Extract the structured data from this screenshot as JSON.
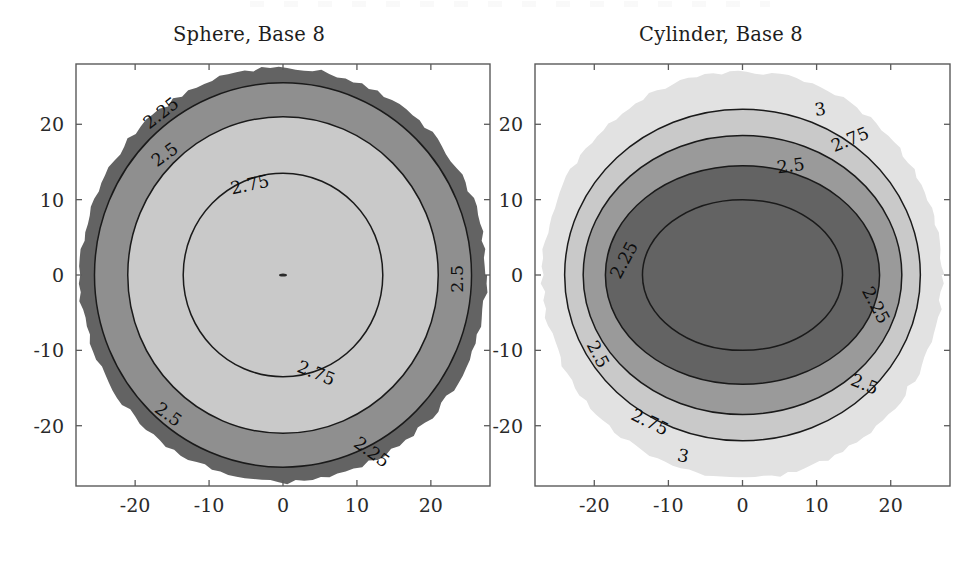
{
  "figure": {
    "width": 980,
    "height": 574,
    "background": "#ffffff"
  },
  "chart_data": [
    {
      "type": "contour",
      "panel": "left",
      "title": "Sphere, Base 8",
      "xlabel": "",
      "ylabel": "",
      "xlim": [
        -28,
        28
      ],
      "ylim": [
        -28,
        28
      ],
      "xticks": [
        "-20",
        "-10",
        "0",
        "10",
        "20"
      ],
      "xtick_values": [
        -20,
        -10,
        0,
        10,
        20
      ],
      "yticks": [
        "20",
        "10",
        "0",
        "-10",
        "-20"
      ],
      "ytick_values": [
        20,
        10,
        0,
        -10,
        -20
      ],
      "grid": false,
      "legend": "none",
      "levels": [
        2.25,
        2.5,
        2.75
      ],
      "level_labels": [
        "2.25",
        "2.5",
        "2.75"
      ],
      "fill_direction": "dark-outside-light-inside",
      "fill_colors": [
        "#636363",
        "#8f8f8f",
        "#c9c9c9"
      ],
      "domain_shape": "disk",
      "domain_radius": 27.5,
      "contour_radii": [
        25.5,
        21.0,
        13.5
      ],
      "center_marker": true,
      "labels": [
        {
          "text": "2.25",
          "x": -16.5,
          "y": 21.5,
          "rotation": -38
        },
        {
          "text": "2.5",
          "x": -16.0,
          "y": 16.0,
          "rotation": -36
        },
        {
          "text": "2.75",
          "x": -4.5,
          "y": 12.0,
          "rotation": -12
        },
        {
          "text": "2.5",
          "x": 23.5,
          "y": -0.5,
          "rotation": -90
        },
        {
          "text": "2.75",
          "x": 4.5,
          "y": -13.0,
          "rotation": 22
        },
        {
          "text": "2.5",
          "x": -15.5,
          "y": -18.5,
          "rotation": 36
        },
        {
          "text": "2.25",
          "x": 12.0,
          "y": -23.5,
          "rotation": 36
        }
      ]
    },
    {
      "type": "contour",
      "panel": "right",
      "title": "Cylinder, Base 8",
      "xlabel": "",
      "ylabel": "",
      "xlim": [
        -28,
        28
      ],
      "ylim": [
        -28,
        28
      ],
      "xticks": [
        "-20",
        "-10",
        "0",
        "10",
        "20"
      ],
      "xtick_values": [
        -20,
        -10,
        0,
        10,
        20
      ],
      "yticks": [
        "20",
        "10",
        "0",
        "-10",
        "-20"
      ],
      "ytick_values": [
        20,
        10,
        0,
        -10,
        -20
      ],
      "grid": false,
      "legend": "none",
      "levels": [
        3,
        2.75,
        2.5,
        2.25
      ],
      "level_labels": [
        "3",
        "2.75",
        "2.5",
        "2.25"
      ],
      "fill_direction": "light-outside-dark-inside",
      "fill_colors": [
        "#e2e2e2",
        "#c9c9c9",
        "#9a9a9a",
        "#636363"
      ],
      "domain_shape": "disk",
      "domain_radius": 27.0,
      "contour_ellipses": [
        {
          "rx": 24.0,
          "ry": 22.0
        },
        {
          "rx": 21.5,
          "ry": 18.5
        },
        {
          "rx": 18.5,
          "ry": 14.5
        },
        {
          "rx": 13.5,
          "ry": 10.0
        }
      ],
      "labels": [
        {
          "text": "3",
          "x": 10.5,
          "y": 22.0,
          "rotation": -8
        },
        {
          "text": "2.75",
          "x": 14.5,
          "y": 18.0,
          "rotation": -22
        },
        {
          "text": "2.5",
          "x": 6.5,
          "y": 14.5,
          "rotation": -8
        },
        {
          "text": "2.25",
          "x": -16.0,
          "y": 2.0,
          "rotation": -62
        },
        {
          "text": "2.25",
          "x": 18.0,
          "y": -4.0,
          "rotation": 62
        },
        {
          "text": "2.5",
          "x": -19.5,
          "y": -10.5,
          "rotation": 62
        },
        {
          "text": "2.5",
          "x": 16.5,
          "y": -14.5,
          "rotation": 22
        },
        {
          "text": "2.75",
          "x": -12.5,
          "y": -19.5,
          "rotation": 26
        },
        {
          "text": "3",
          "x": -8.0,
          "y": -24.0,
          "rotation": 12
        }
      ]
    }
  ]
}
